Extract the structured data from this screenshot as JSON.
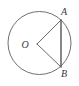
{
  "figure": {
    "kind": "circle-geometry-diagram",
    "background_color": "#ffffff",
    "stroke_color": "#6f6f6f",
    "chord_color": "#555555",
    "label_color": "#3a3a3a",
    "circle": {
      "center_x": 39.5,
      "center_y": 43,
      "radius": 31.5
    },
    "points": [
      {
        "name": "A",
        "label": "A",
        "x": 61,
        "y": 20,
        "label_x": 64,
        "label_y": 15
      },
      {
        "name": "B",
        "label": "B",
        "x": 61,
        "y": 67,
        "label_x": 64,
        "label_y": 77
      },
      {
        "name": "O",
        "label": "O",
        "x": 37,
        "y": 44,
        "label_x": 25,
        "label_y": 48
      }
    ],
    "segments": [
      {
        "name": "chord-ab",
        "from": "A",
        "to": "B",
        "x1": 61,
        "y1": 20,
        "x2": 61,
        "y2": 67
      },
      {
        "name": "radius-oa",
        "from": "O",
        "to": "A",
        "x1": 37,
        "y1": 44,
        "x2": 61,
        "y2": 20
      },
      {
        "name": "radius-ob",
        "from": "O",
        "to": "B",
        "x1": 37,
        "y1": 44,
        "x2": 61,
        "y2": 67
      }
    ]
  }
}
